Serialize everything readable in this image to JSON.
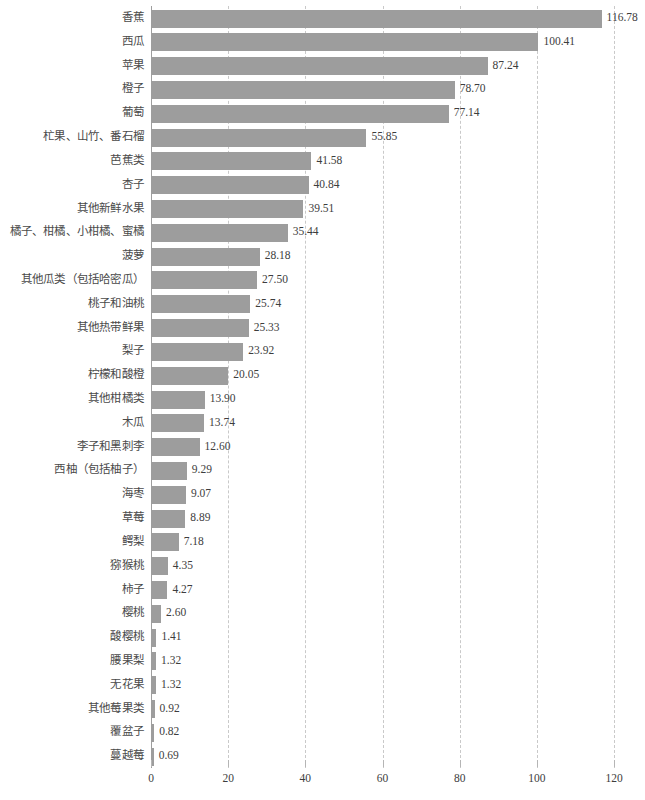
{
  "chart_data": {
    "type": "bar",
    "orientation": "horizontal",
    "title": "",
    "subtitle": "",
    "xlabel": "",
    "ylabel": "",
    "xlim": [
      0,
      120
    ],
    "xticks": [
      0,
      20,
      40,
      60,
      80,
      100,
      120
    ],
    "xtick_labels": [
      "0",
      "20",
      "40",
      "60",
      "80",
      "100",
      "120"
    ],
    "grid": true,
    "grid_axis": "x",
    "grid_style": "dashed",
    "legend": false,
    "bar_color": "#9d9d9d",
    "value_label_format": "0.00",
    "categories": [
      "香蕉",
      "西瓜",
      "苹果",
      "橙子",
      "葡萄",
      "杧果、山竹、番石榴",
      "芭蕉类",
      "杏子",
      "其他新鲜水果",
      "橘子、柑橘、小柑橘、蜜橘",
      "菠萝",
      "其他瓜类（包括哈密瓜）",
      "桃子和油桃",
      "其他热带鲜果",
      "梨子",
      "柠檬和酸橙",
      "其他柑橘类",
      "木瓜",
      "李子和黑刺李",
      "西柚（包括柚子）",
      "海枣",
      "草莓",
      "鳄梨",
      "猕猴桃",
      "柿子",
      "樱桃",
      "酸樱桃",
      "腰果梨",
      "无花果",
      "其他莓果类",
      "覆盆子",
      "蔓越莓"
    ],
    "values": [
      116.78,
      100.41,
      87.24,
      78.7,
      77.14,
      55.85,
      41.58,
      40.84,
      39.51,
      35.44,
      28.18,
      27.5,
      25.74,
      25.33,
      23.92,
      20.05,
      13.9,
      13.74,
      12.6,
      9.29,
      9.07,
      8.89,
      7.18,
      4.35,
      4.27,
      2.6,
      1.41,
      1.32,
      1.32,
      0.92,
      0.82,
      0.69
    ],
    "value_labels": [
      "116.78",
      "100.41",
      "87.24",
      "78.70",
      "77.14",
      "55.85",
      "41.58",
      "40.84",
      "39.51",
      "35.44",
      "28.18",
      "27.50",
      "25.74",
      "25.33",
      "23.92",
      "20.05",
      "13.90",
      "13.74",
      "12.60",
      "9.29",
      "9.07",
      "8.89",
      "7.18",
      "4.35",
      "4.27",
      "2.60",
      "1.41",
      "1.32",
      "1.32",
      "0.92",
      "0.82",
      "0.69"
    ]
  }
}
